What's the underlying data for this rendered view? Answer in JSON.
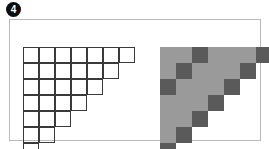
{
  "figure": {
    "marker_label": "4",
    "marker_icon": "filled-circle-number-icon",
    "panel_border_color": "#b9b9b9",
    "background_color": "#ffffff"
  },
  "left_diagram": {
    "name": "outline-staircase-grid",
    "description": "Outlined square grid forming a right triangle staircase",
    "rows": 7,
    "columns": 7,
    "cell_size_px": 16,
    "row_cell_counts": [
      7,
      6,
      5,
      4,
      3,
      2,
      1
    ],
    "line_color": "#3a3a3a",
    "fill_color": "none"
  },
  "right_diagram": {
    "name": "shaded-staircase-grid",
    "description": "Shaded square grid staircase with darker highlighted cells on two anti-diagonals",
    "rows": 7,
    "columns": 7,
    "cell_size_px": 16,
    "row_cell_counts": [
      7,
      6,
      5,
      4,
      3,
      2,
      1
    ],
    "light_color": "#9a9a9a",
    "dark_color": "#5a5a5a",
    "dark_cells": [
      {
        "row": 1,
        "cols": [
          3,
          7
        ]
      },
      {
        "row": 2,
        "cols": [
          2,
          6
        ]
      },
      {
        "row": 3,
        "cols": [
          1,
          5
        ]
      },
      {
        "row": 4,
        "cols": [
          4
        ]
      },
      {
        "row": 5,
        "cols": [
          3
        ]
      },
      {
        "row": 6,
        "cols": [
          2
        ]
      },
      {
        "row": 7,
        "cols": [
          1
        ]
      }
    ]
  },
  "chart_data": {
    "type": "heatmap",
    "title": "",
    "xlabel": "",
    "ylabel": "",
    "categories": [
      "1",
      "2",
      "3",
      "4",
      "5",
      "6",
      "7"
    ],
    "row_labels": [
      "1",
      "2",
      "3",
      "4",
      "5",
      "6",
      "7"
    ],
    "grid": true,
    "legend": "none",
    "series": [
      {
        "name": "outline-staircase",
        "values": [
          [
            1,
            1,
            1,
            1,
            1,
            1,
            1
          ],
          [
            1,
            1,
            1,
            1,
            1,
            1,
            0
          ],
          [
            1,
            1,
            1,
            1,
            1,
            0,
            0
          ],
          [
            1,
            1,
            1,
            1,
            0,
            0,
            0
          ],
          [
            1,
            1,
            1,
            0,
            0,
            0,
            0
          ],
          [
            1,
            1,
            0,
            0,
            0,
            0,
            0
          ],
          [
            1,
            0,
            0,
            0,
            0,
            0,
            0
          ]
        ]
      },
      {
        "name": "shaded-staircase",
        "values": [
          [
            1,
            1,
            2,
            1,
            1,
            1,
            2
          ],
          [
            1,
            2,
            1,
            1,
            1,
            2,
            0
          ],
          [
            2,
            1,
            1,
            1,
            2,
            0,
            0
          ],
          [
            1,
            1,
            1,
            2,
            0,
            0,
            0
          ],
          [
            1,
            1,
            2,
            0,
            0,
            0,
            0
          ],
          [
            1,
            2,
            0,
            0,
            0,
            0,
            0
          ],
          [
            2,
            0,
            0,
            0,
            0,
            0,
            0
          ]
        ]
      }
    ],
    "value_legend": {
      "0": "empty / no cell",
      "1": "light gray cell",
      "2": "dark gray cell"
    }
  }
}
